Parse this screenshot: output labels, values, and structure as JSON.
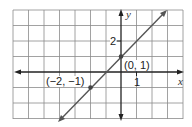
{
  "graph": {
    "axes": {
      "x_label": "x",
      "y_label": "y"
    },
    "tick_labels": {
      "x_tick": "1",
      "y_tick": "2"
    },
    "points": [
      {
        "label": "(0, 1)",
        "x": 0,
        "y": 1
      },
      {
        "label": "(−2, −1)",
        "x": -2,
        "y": -1
      }
    ],
    "line": {
      "equation": "y = x + 1",
      "slope": 1,
      "intercept": 1
    },
    "grid": {
      "x_range": [
        -7,
        4
      ],
      "y_range": [
        -3,
        4
      ],
      "step": 1
    },
    "colors": {
      "grid": "#888888",
      "axis": "#222222",
      "line": "#555555",
      "point": "#444444"
    }
  }
}
